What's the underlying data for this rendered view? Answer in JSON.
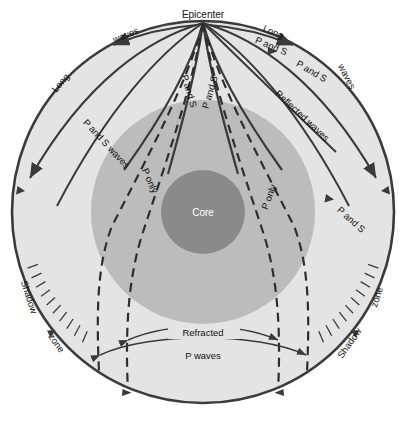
{
  "diagram": {
    "colors": {
      "outer_shell_fill": "#e4e4e4",
      "mantle_fill": "#bcbcbc",
      "core_fill": "#8a8a8a",
      "stroke": "#3b3b3b",
      "ray_stroke": "#3a3a3a",
      "background": "#ffffff",
      "core_text": "#ffffff",
      "label_text": "#111111"
    },
    "geometry": {
      "outer_circle": {
        "cx": 203,
        "cy": 212,
        "r": 192
      },
      "mantle_circle": {
        "cx": 203,
        "cy": 212,
        "r": 112
      },
      "core_circle": {
        "cx": 203,
        "cy": 212,
        "r": 42
      },
      "epicenter": {
        "x": 203,
        "y": 23
      }
    },
    "labels": {
      "epicenter": "Epicenter",
      "core": "Core",
      "long_left": "Long",
      "waves_left": "waves",
      "long_right": "Long",
      "waves_right": "waves",
      "p_and_s_left_surface": "P and S waves",
      "p_and_s_right_upper": "P and S",
      "p_and_s_right_mid": "P and S",
      "p_and_s_right_lower": "P and S",
      "p_and_s_inner_left": "P and S",
      "p_and_s_inner_right": "P and S",
      "reflected_waves": "Reflected waves",
      "p_only_left": "P only",
      "p_only_right": "P only",
      "shadow_left_a": "Shadow",
      "shadow_left_b": "zone",
      "shadow_right_a": "Shadow",
      "shadow_right_b": "zone",
      "refracted": "Refracted",
      "p_waves": "P waves"
    }
  }
}
